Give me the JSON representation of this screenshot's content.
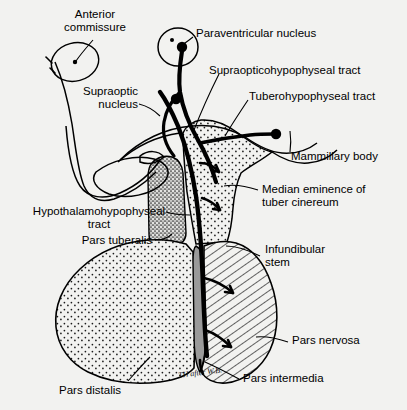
{
  "figure": {
    "background_color": "#f2f2f0",
    "ink_color": "#000000",
    "signature": "TH after W.B."
  },
  "labels": {
    "anterior_commissure": "Anterior\ncommissure",
    "supraoptic_nucleus": "Supraoptic\nnucleus",
    "paraventricular_nucleus": "Paraventricular nucleus",
    "supraopticohypophyseal_tract": "Supraopticohypophyseal tract",
    "tuberohypophyseal_tract": "Tuberohypophyseal tract",
    "mammillary_body": "Mammillary body",
    "median_eminence": "Median eminence of\ntuber cinereum",
    "hypothalamohypophyseal_tract": "Hypothalamohypophyseal\ntract",
    "pars_tuberalis": "Pars tuberalis",
    "infundibular_stem": "Infundibular\nstem",
    "pars_nervosa": "Pars nervosa",
    "pars_intermedia": "Pars intermedia",
    "pars_distalis": "Pars distalis"
  },
  "regions": {
    "median_eminence_fill": "fine-stipple",
    "pars_tuberalis_fill": "dense-stipple-gray",
    "pars_distalis_fill": "fine-stipple",
    "pars_intermedia_fill": "solid-gray",
    "pars_nervosa_fill": "diagonal-hatch"
  },
  "colors": {
    "stipple_gray": "#8a8a8a",
    "pars_intermedia_gray": "#9a9a9a",
    "hatch_line": "#1a1a1a"
  }
}
